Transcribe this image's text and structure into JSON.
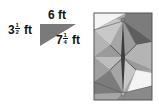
{
  "triangle": {
    "fill": "#7a7a7a",
    "top_side": {
      "whole": "6",
      "unit": "ft"
    },
    "left_side": {
      "whole": "3",
      "num": "1",
      "den": "2",
      "unit": "ft"
    },
    "hypotenuse": {
      "whole": "7",
      "num": "1",
      "den": "4",
      "unit": "ft"
    }
  },
  "quilt": {
    "border": "#555555",
    "colors": {
      "white": "#f4f4f4",
      "light": "#c8c8c8",
      "mid": "#a6a6a6",
      "dark": "#7c7c7c",
      "darker": "#5e5e5e"
    }
  }
}
